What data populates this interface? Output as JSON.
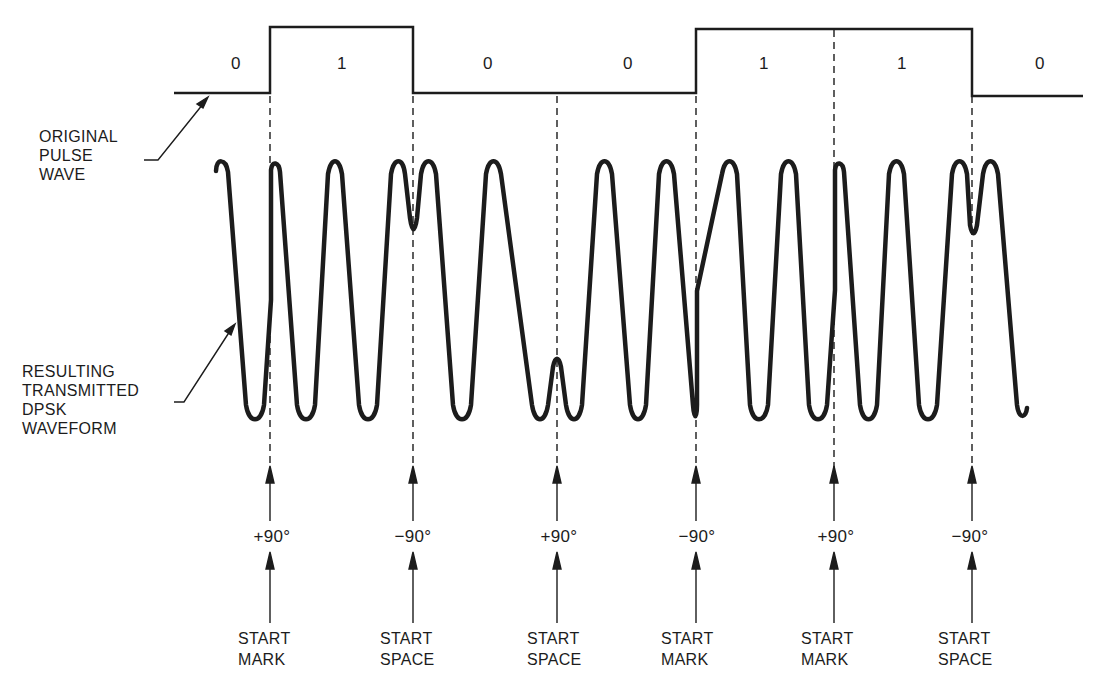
{
  "labels": {
    "original_pulse_wave": [
      "ORIGINAL",
      "PULSE",
      "WAVE"
    ],
    "dpsk_waveform": [
      "RESULTING",
      "TRANSMITTED",
      "DPSK",
      "WAVEFORM"
    ]
  },
  "bits": [
    {
      "value": "0",
      "x": 236
    },
    {
      "value": "1",
      "x": 342
    },
    {
      "value": "0",
      "x": 488
    },
    {
      "value": "0",
      "x": 628
    },
    {
      "value": "1",
      "x": 764
    },
    {
      "value": "1",
      "x": 902
    },
    {
      "value": "0",
      "x": 1040
    }
  ],
  "transitions": [
    {
      "x": 270,
      "phase": "+90°",
      "event_line1": "START",
      "event_line2": "MARK"
    },
    {
      "x": 413,
      "phase": "−90°",
      "event_line1": "START",
      "event_line2": "SPACE"
    },
    {
      "x": 557,
      "phase": "+90°",
      "event_line1": "START",
      "event_line2": "SPACE"
    },
    {
      "x": 696,
      "phase": "−90°",
      "event_line1": "START",
      "event_line2": "MARK"
    },
    {
      "x": 834,
      "phase": "+90°",
      "event_line1": "START",
      "event_line2": "MARK"
    },
    {
      "x": 972,
      "phase": "−90°",
      "event_line1": "START",
      "event_line2": "SPACE"
    }
  ],
  "colors": {
    "ink": "#1c1c1c",
    "background": "#ffffff"
  }
}
